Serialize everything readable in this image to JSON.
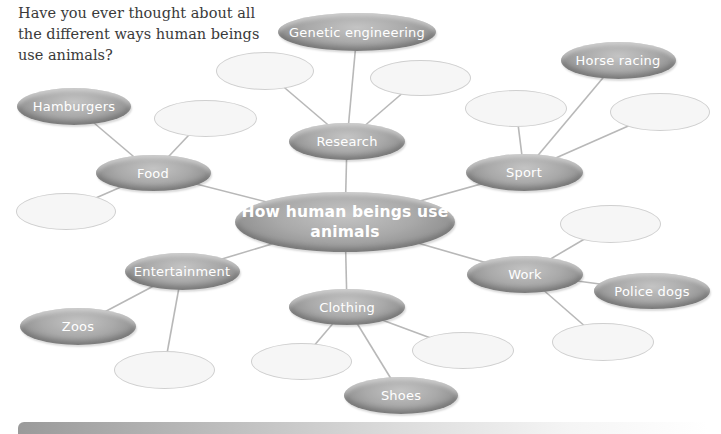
{
  "intro_text": "Have you ever thought about all the different ways human beings use animals?",
  "colors": {
    "node_fill": "#a9a9a9",
    "node_text": "#ffffff",
    "empty_fill": "#f6f6f6",
    "empty_border": "#cfcfcf",
    "link": "#b8b8b8"
  },
  "mindmap": {
    "center": {
      "label": "How human beings use animals",
      "cx": 345,
      "cy": 222,
      "w": 220,
      "h": 60
    },
    "nodes": [
      {
        "id": "research",
        "label": "Research",
        "cx": 347,
        "cy": 141,
        "w": 116,
        "h": 37,
        "parent": "center"
      },
      {
        "id": "genetic",
        "label": "Genetic engineering",
        "cx": 357,
        "cy": 32,
        "w": 158,
        "h": 38,
        "parent": "research"
      },
      {
        "id": "food",
        "label": "Food",
        "cx": 153,
        "cy": 173,
        "w": 115,
        "h": 36,
        "parent": "center"
      },
      {
        "id": "hamburgers",
        "label": "Hamburgers",
        "cx": 74,
        "cy": 106,
        "w": 114,
        "h": 37,
        "parent": "food"
      },
      {
        "id": "sport",
        "label": "Sport",
        "cx": 524,
        "cy": 172,
        "w": 117,
        "h": 37,
        "parent": "center"
      },
      {
        "id": "horse",
        "label": "Horse racing",
        "cx": 618,
        "cy": 60,
        "w": 115,
        "h": 37,
        "parent": "sport"
      },
      {
        "id": "entertainment",
        "label": "Entertainment",
        "cx": 182,
        "cy": 271,
        "w": 115,
        "h": 37,
        "parent": "center"
      },
      {
        "id": "zoos",
        "label": "Zoos",
        "cx": 78,
        "cy": 326,
        "w": 116,
        "h": 37,
        "parent": "entertainment"
      },
      {
        "id": "work",
        "label": "Work",
        "cx": 525,
        "cy": 274,
        "w": 116,
        "h": 37,
        "parent": "center"
      },
      {
        "id": "police",
        "label": "Police dogs",
        "cx": 652,
        "cy": 291,
        "w": 116,
        "h": 36,
        "parent": "work"
      },
      {
        "id": "clothing",
        "label": "Clothing",
        "cx": 347,
        "cy": 307,
        "w": 116,
        "h": 36,
        "parent": "center"
      },
      {
        "id": "shoes",
        "label": "Shoes",
        "cx": 401,
        "cy": 395,
        "w": 114,
        "h": 37,
        "parent": "clothing"
      }
    ],
    "empty_nodes": [
      {
        "cx": 265,
        "cy": 71,
        "w": 98,
        "h": 38,
        "parent": "research"
      },
      {
        "cx": 420,
        "cy": 78,
        "w": 101,
        "h": 36,
        "parent": "research"
      },
      {
        "cx": 205,
        "cy": 118,
        "w": 103,
        "h": 37,
        "parent": "food"
      },
      {
        "cx": 66,
        "cy": 211,
        "w": 100,
        "h": 37,
        "parent": "food"
      },
      {
        "cx": 516,
        "cy": 108,
        "w": 102,
        "h": 37,
        "parent": "sport"
      },
      {
        "cx": 660,
        "cy": 112,
        "w": 100,
        "h": 38,
        "parent": "sport"
      },
      {
        "cx": 610,
        "cy": 224,
        "w": 101,
        "h": 38,
        "parent": "work"
      },
      {
        "cx": 603,
        "cy": 342,
        "w": 102,
        "h": 38,
        "parent": "work"
      },
      {
        "cx": 164,
        "cy": 370,
        "w": 101,
        "h": 38,
        "parent": "entertainment"
      },
      {
        "cx": 301,
        "cy": 361,
        "w": 101,
        "h": 37,
        "parent": "clothing"
      },
      {
        "cx": 463,
        "cy": 350,
        "w": 102,
        "h": 37,
        "parent": "clothing"
      }
    ]
  }
}
